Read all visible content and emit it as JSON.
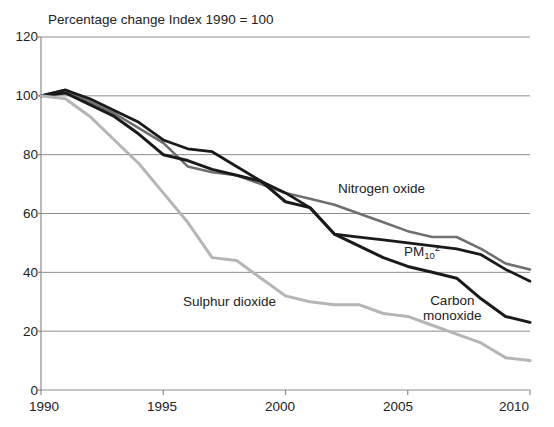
{
  "chart_data": {
    "type": "line",
    "title": "Percentage change Index 1990 = 100",
    "xlabel": "",
    "ylabel": "",
    "xlim": [
      1990,
      2010
    ],
    "ylim": [
      0,
      120
    ],
    "ytick_values": [
      0,
      20,
      40,
      60,
      80,
      100,
      120
    ],
    "ytick_labels": [
      "0",
      "20",
      "40",
      "60",
      "80",
      "100",
      "120"
    ],
    "xtick_values": [
      1990,
      1995,
      2000,
      2005,
      2010
    ],
    "xtick_labels": [
      "1990",
      "1995",
      "2000",
      "2005",
      "2010"
    ],
    "grid": "horizontal",
    "legend_position": "inline-annotations",
    "x": [
      1990,
      1991,
      1992,
      1993,
      1994,
      1995,
      1996,
      1997,
      1998,
      1999,
      2000,
      2001,
      2002,
      2003,
      2004,
      2005,
      2006,
      2007,
      2008,
      2009,
      2010
    ],
    "series": [
      {
        "name": "Nitrogen oxide",
        "color": "#6f6f6f",
        "width": 2.6,
        "values": [
          100,
          102,
          98,
          94,
          89,
          84,
          76,
          74,
          73,
          70,
          67,
          65,
          63,
          60,
          57,
          54,
          52,
          52,
          48,
          43,
          41
        ]
      },
      {
        "name": "PM10 2",
        "color": "#1a1a1a",
        "width": 2.8,
        "values": [
          100,
          102,
          99,
          95,
          91,
          85,
          82,
          81,
          76,
          71,
          67,
          62,
          53,
          52,
          51,
          50,
          49,
          48,
          46,
          41,
          37
        ]
      },
      {
        "name": "Carbon monoxide",
        "color": "#1a1a1a",
        "width": 3.0,
        "values": [
          100,
          101,
          97,
          93,
          87,
          80,
          78,
          75,
          73,
          71,
          64,
          62,
          53,
          49,
          45,
          42,
          40,
          38,
          31,
          25,
          23
        ]
      },
      {
        "name": "Sulphur dioxide",
        "color": "#b5b5b5",
        "width": 3.0,
        "values": [
          100,
          99,
          93,
          85,
          77,
          67,
          57,
          45,
          44,
          38,
          32,
          30,
          29,
          29,
          26,
          25,
          22,
          19,
          16,
          11,
          10
        ]
      }
    ],
    "annotations": [
      {
        "name": "nitrogen-oxide",
        "text": "Nitrogen oxide",
        "x_px": 338,
        "y_px": 181
      },
      {
        "name": "pm10",
        "text": "PM10 2",
        "x_px": 404,
        "y_px": 245
      },
      {
        "name": "sulphur-dioxide",
        "text": "Sulphur dioxide",
        "x_px": 183,
        "y_px": 294
      },
      {
        "name": "carbon-monoxide-line1",
        "text": "Carbon",
        "x_px": 427,
        "y_px": 295
      },
      {
        "name": "carbon-monoxide-line2",
        "text": "monoxide",
        "x_px": 427,
        "y_px": 312
      }
    ]
  },
  "labels": {
    "title": "Percentage change Index 1990 = 100",
    "y0": "0",
    "y20": "20",
    "y40": "40",
    "y60": "60",
    "y80": "80",
    "y100": "100",
    "y120": "120",
    "x1990": "1990",
    "x1995": "1995",
    "x2000": "2000",
    "x2005": "2005",
    "x2010": "2010",
    "nitrogen_oxide": "Nitrogen oxide",
    "sulphur_dioxide": "Sulphur dioxide",
    "carbon_monoxide_1": "Carbon",
    "carbon_monoxide_2": "monoxide",
    "pm_prefix": "PM",
    "pm_sub": "10",
    "pm_sup": "2"
  }
}
